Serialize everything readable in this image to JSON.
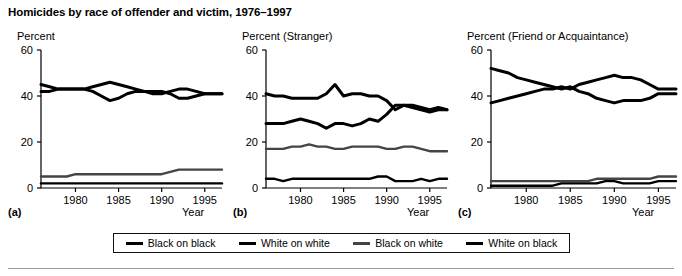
{
  "figure": {
    "title": "Homicides by race of offender and victim, 1976–1997"
  },
  "legend": {
    "items": [
      {
        "label": "Black on black",
        "color": "#000000",
        "key": "black_on_black"
      },
      {
        "label": "White on white",
        "color": "#000000",
        "key": "white_on_white"
      },
      {
        "label": "Black on white",
        "color": "#444444",
        "key": "black_on_white"
      },
      {
        "label": "White on black",
        "color": "#000000",
        "key": "white_on_black"
      }
    ]
  },
  "panels": [
    {
      "id": "a",
      "letter": "(a)",
      "ylabel": "Percent",
      "xlabel": "Year"
    },
    {
      "id": "b",
      "letter": "(b)",
      "ylabel": "Percent (Stranger)",
      "xlabel": "Year"
    },
    {
      "id": "c",
      "letter": "(c)",
      "ylabel": "Percent (Friend or Acquaintance)",
      "xlabel": "Year"
    }
  ],
  "axis": {
    "yticks": [
      0,
      20,
      40,
      60
    ],
    "xticks": [
      1980,
      1985,
      1990,
      1995
    ],
    "ylim": [
      0,
      60
    ],
    "xlim": [
      1976,
      1997
    ]
  },
  "chart_data": [
    {
      "type": "line",
      "panel": "a",
      "title": "Percent",
      "xlabel": "Year",
      "ylabel": "Percent",
      "xlim": [
        1976,
        1997
      ],
      "ylim": [
        0,
        60
      ],
      "grid": false,
      "legend_position": "below-figure",
      "x": [
        1976,
        1977,
        1978,
        1979,
        1980,
        1981,
        1982,
        1983,
        1984,
        1985,
        1986,
        1987,
        1988,
        1989,
        1990,
        1991,
        1992,
        1993,
        1994,
        1995,
        1996,
        1997
      ],
      "series": [
        {
          "name": "Black on black",
          "values": [
            45,
            44,
            43,
            43,
            43,
            43,
            44,
            45,
            46,
            45,
            44,
            43,
            42,
            42,
            42,
            41,
            39,
            39,
            40,
            41,
            41,
            41
          ]
        },
        {
          "name": "White on white",
          "values": [
            42,
            42,
            43,
            43,
            43,
            43,
            42,
            40,
            38,
            39,
            41,
            42,
            42,
            41,
            41,
            42,
            43,
            43,
            42,
            41,
            41,
            41
          ]
        },
        {
          "name": "Black on white",
          "values": [
            5,
            5,
            5,
            5,
            6,
            6,
            6,
            6,
            6,
            6,
            6,
            6,
            6,
            6,
            6,
            7,
            8,
            8,
            8,
            8,
            8,
            8
          ]
        },
        {
          "name": "White on black",
          "values": [
            2,
            2,
            2,
            2,
            2,
            2,
            2,
            2,
            2,
            2,
            2,
            2,
            2,
            2,
            2,
            2,
            2,
            2,
            2,
            2,
            2,
            2
          ]
        }
      ]
    },
    {
      "type": "line",
      "panel": "b",
      "title": "Percent (Stranger)",
      "xlabel": "Year",
      "ylabel": "Percent (Stranger)",
      "xlim": [
        1976,
        1997
      ],
      "ylim": [
        0,
        60
      ],
      "grid": false,
      "legend_position": "below-figure",
      "x": [
        1976,
        1977,
        1978,
        1979,
        1980,
        1981,
        1982,
        1983,
        1984,
        1985,
        1986,
        1987,
        1988,
        1989,
        1990,
        1991,
        1992,
        1993,
        1994,
        1995,
        1996,
        1997
      ],
      "series": [
        {
          "name": "Black on black",
          "values": [
            41,
            40,
            40,
            39,
            39,
            39,
            39,
            41,
            45,
            40,
            41,
            41,
            40,
            40,
            38,
            34,
            36,
            36,
            35,
            34,
            35,
            34
          ]
        },
        {
          "name": "White on white",
          "values": [
            28,
            28,
            28,
            29,
            30,
            29,
            28,
            26,
            28,
            28,
            27,
            28,
            30,
            29,
            32,
            36,
            36,
            35,
            34,
            33,
            34,
            34
          ]
        },
        {
          "name": "Black on white",
          "values": [
            17,
            17,
            17,
            18,
            18,
            19,
            18,
            18,
            17,
            17,
            18,
            18,
            18,
            18,
            17,
            17,
            18,
            18,
            17,
            16,
            16,
            16
          ]
        },
        {
          "name": "White on black",
          "values": [
            4,
            4,
            3,
            4,
            4,
            4,
            4,
            4,
            4,
            4,
            4,
            4,
            4,
            5,
            5,
            3,
            3,
            3,
            4,
            3,
            4,
            4
          ]
        }
      ]
    },
    {
      "type": "line",
      "panel": "c",
      "title": "Percent (Friend or Acquaintance)",
      "xlabel": "Year",
      "ylabel": "Percent (Friend or Acquaintance)",
      "xlim": [
        1976,
        1997
      ],
      "ylim": [
        0,
        60
      ],
      "grid": false,
      "legend_position": "below-figure",
      "x": [
        1976,
        1977,
        1978,
        1979,
        1980,
        1981,
        1982,
        1983,
        1984,
        1985,
        1986,
        1987,
        1988,
        1989,
        1990,
        1991,
        1992,
        1993,
        1994,
        1995,
        1996,
        1997
      ],
      "series": [
        {
          "name": "Black on black",
          "values": [
            52,
            51,
            50,
            48,
            47,
            46,
            45,
            44,
            43,
            44,
            42,
            41,
            39,
            38,
            37,
            38,
            38,
            38,
            39,
            41,
            41,
            41
          ]
        },
        {
          "name": "White on white",
          "values": [
            37,
            38,
            39,
            40,
            41,
            42,
            43,
            43,
            44,
            43,
            45,
            46,
            47,
            48,
            49,
            48,
            48,
            47,
            45,
            43,
            43,
            43
          ]
        },
        {
          "name": "Black on white",
          "values": [
            3,
            3,
            3,
            3,
            3,
            3,
            3,
            3,
            3,
            3,
            3,
            3,
            4,
            4,
            4,
            4,
            4,
            4,
            4,
            5,
            5,
            5
          ]
        },
        {
          "name": "White on black",
          "values": [
            1,
            1,
            1,
            1,
            1,
            1,
            1,
            1,
            2,
            2,
            2,
            2,
            2,
            3,
            3,
            2,
            2,
            2,
            2,
            3,
            3,
            3
          ]
        }
      ]
    }
  ]
}
